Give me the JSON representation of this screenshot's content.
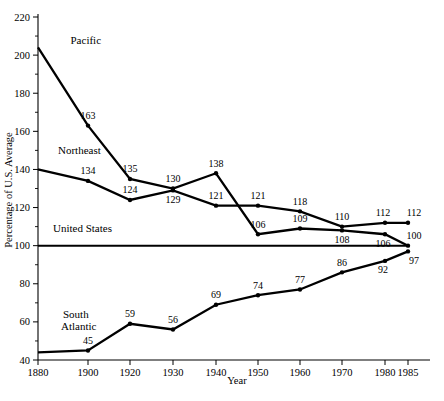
{
  "chart_data": {
    "type": "line",
    "title": "",
    "xlabel": "Year",
    "ylabel": "Percentage of U.S. Average",
    "xlim": [
      1880,
      1985
    ],
    "ylim": [
      40,
      220
    ],
    "ytick_step": 20,
    "yticks": [
      40,
      60,
      80,
      100,
      120,
      140,
      160,
      180,
      200,
      220
    ],
    "yticks_minor": [
      50,
      70,
      90,
      110,
      130,
      150,
      170,
      190,
      210
    ],
    "xticks": [
      1880,
      1900,
      1920,
      1930,
      1940,
      1950,
      1960,
      1970,
      1980,
      1985
    ],
    "xtick_labels": [
      "1880",
      "1900",
      "1920",
      "1930",
      "1940",
      "1950",
      "1960",
      "1970",
      "1980",
      "1985"
    ],
    "grid": false,
    "legend": "inline-labels",
    "series": [
      {
        "name": "Pacific",
        "label_x": 1893,
        "label_y": 206,
        "x": [
          1880,
          1900,
          1920,
          1930,
          1940,
          1950,
          1960,
          1970,
          1980,
          1985
        ],
        "values": [
          204,
          163,
          135,
          130,
          138,
          106,
          109,
          108,
          106,
          100
        ],
        "point_labels": [
          "",
          "163",
          "135",
          "130",
          "138",
          "106",
          "109",
          "108",
          "106",
          "100"
        ],
        "label_offsets": [
          "",
          "above",
          "above",
          "above",
          "above",
          "above",
          "above",
          "below",
          "below",
          "above"
        ]
      },
      {
        "name": "Northeast",
        "label_x": 1888,
        "label_y": 148,
        "x": [
          1880,
          1900,
          1920,
          1930,
          1940,
          1950,
          1960,
          1970,
          1980,
          1985
        ],
        "values": [
          140,
          134,
          124,
          129,
          121,
          121,
          118,
          110,
          112,
          112
        ],
        "point_labels": [
          "",
          "134",
          "124",
          "129",
          "121",
          "121",
          "118",
          "110",
          "112",
          "112"
        ],
        "label_offsets": [
          "",
          "above",
          "above",
          "below",
          "above",
          "above",
          "above",
          "above",
          "above",
          "above"
        ]
      },
      {
        "name": "United States",
        "label_x": 1886,
        "label_y": 107,
        "x": [
          1880,
          1985
        ],
        "values": [
          100,
          100
        ],
        "point_labels": [
          "",
          ""
        ],
        "label_offsets": [
          "",
          ""
        ]
      },
      {
        "name": "South Atlantic",
        "label_x": 1890,
        "label_y": 62,
        "x": [
          1880,
          1900,
          1920,
          1930,
          1940,
          1950,
          1960,
          1970,
          1980,
          1985
        ],
        "values": [
          44,
          45,
          59,
          56,
          69,
          74,
          77,
          86,
          92,
          97
        ],
        "point_labels": [
          "",
          "45",
          "59",
          "56",
          "69",
          "74",
          "77",
          "86",
          "92",
          "97"
        ],
        "label_offsets": [
          "",
          "above",
          "above",
          "above",
          "above",
          "above",
          "above",
          "above",
          "below",
          "below"
        ]
      }
    ]
  },
  "axes": {
    "x_title": "Year",
    "y_title": "Percentage of U.S. Average"
  },
  "footer": {
    "source_note": ""
  }
}
